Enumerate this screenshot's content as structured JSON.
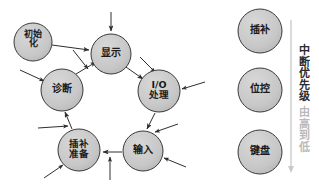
{
  "diagram": {
    "style": {
      "node_fill": "#c9c9c9",
      "node_stroke": "#3a3a3a",
      "arrow_color": "#2e2e2e",
      "background": "#ffffff",
      "faded_text": "#b9b9b9"
    },
    "cycle_nodes": [
      {
        "id": "init",
        "label": "初始\n化",
        "cx": 33,
        "cy": 42,
        "r": 19,
        "font": 9
      },
      {
        "id": "display",
        "label": "显示",
        "cx": 111,
        "cy": 54,
        "r": 20,
        "font": 10
      },
      {
        "id": "io",
        "label": "I/O\n处理",
        "cx": 159,
        "cy": 91,
        "r": 21,
        "font": 9.5
      },
      {
        "id": "input",
        "label": "输入",
        "cx": 143,
        "cy": 151,
        "r": 20,
        "font": 10
      },
      {
        "id": "prep",
        "label": "插补\n准备",
        "cx": 79,
        "cy": 150,
        "r": 21,
        "font": 9.5
      },
      {
        "id": "diag",
        "label": "诊断",
        "cx": 62,
        "cy": 90,
        "r": 21,
        "font": 10
      }
    ],
    "priority_nodes": [
      {
        "id": "interp",
        "label": "插补",
        "cx": 260,
        "cy": 31,
        "r": 22,
        "font": 10
      },
      {
        "id": "pos",
        "label": "位控",
        "cx": 260,
        "cy": 90,
        "r": 22,
        "font": 10
      },
      {
        "id": "keybd",
        "label": "键盘",
        "cx": 260,
        "cy": 152,
        "r": 22,
        "font": 10
      }
    ],
    "priority_axis": {
      "label_main": "中断优先级",
      "label_sub": "由高到低",
      "x": 303,
      "y_top": 20,
      "y_bottom": 172
    },
    "flow_edges": [
      {
        "from": "init",
        "to": "display",
        "type": "arrow"
      },
      {
        "from": "display",
        "to": "io",
        "type": "arrow"
      },
      {
        "from": "io",
        "to": "input",
        "type": "arrow"
      },
      {
        "from": "input",
        "to": "prep",
        "type": "arrow"
      },
      {
        "from": "prep",
        "to": "diag",
        "type": "arrow"
      },
      {
        "from": "diag",
        "to": "display",
        "type": "arrow"
      }
    ],
    "interrupt_arrows": [
      {
        "target": "display",
        "direction": "top"
      },
      {
        "target": "io",
        "direction": "right"
      },
      {
        "target": "input",
        "direction": "bottom-right"
      },
      {
        "target": "input",
        "direction": "bottom"
      },
      {
        "target": "prep",
        "direction": "bottom-left"
      },
      {
        "target": "prep",
        "direction": "left"
      },
      {
        "target": "diag",
        "direction": "left"
      },
      {
        "target": "diag",
        "direction": "bottom-left"
      }
    ]
  }
}
